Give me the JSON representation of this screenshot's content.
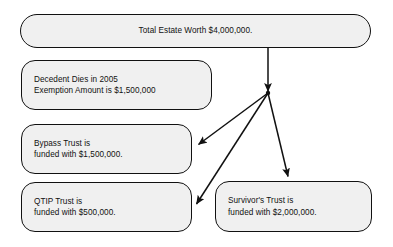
{
  "diagram": {
    "background_color": "#ffffff",
    "node_fill_color": "#f0f0f0",
    "node_border_color": "#111111",
    "text_color": "#111111",
    "nodes": [
      {
        "id": "total-estate",
        "name": "total-estate-node",
        "lines": [
          "Total Estate Worth $4,000,000."
        ],
        "x": 20,
        "y": 14,
        "width": 351,
        "height": 34,
        "align": "center"
      },
      {
        "id": "decedent",
        "name": "decedent-node",
        "lines": [
          "Decedent Dies in 2005",
          "Exemption Amount is $1,500,000"
        ],
        "x": 21,
        "y": 60,
        "width": 191,
        "height": 50,
        "align": "left"
      },
      {
        "id": "bypass-trust",
        "name": "bypass-trust-node",
        "lines": [
          "Bypass Trust is",
          "funded with $1,500,000."
        ],
        "x": 21,
        "y": 124,
        "width": 171,
        "height": 50,
        "align": "left"
      },
      {
        "id": "qtip-trust",
        "name": "qtip-trust-node",
        "lines": [
          "QTIP Trust is",
          "funded with $500,000."
        ],
        "x": 21,
        "y": 182,
        "width": 171,
        "height": 50,
        "align": "left"
      },
      {
        "id": "survivors-trust",
        "name": "survivors-trust-node",
        "lines": [
          "Survivor's Trust is",
          "funded with $2,000,000."
        ],
        "x": 215,
        "y": 181,
        "width": 157,
        "height": 51,
        "align": "left"
      }
    ],
    "junction": {
      "name": "arrow-junction-point",
      "x": 268,
      "y": 93
    },
    "edges": [
      {
        "id": "estate-to-junction",
        "name": "edge-total-estate-to-junction",
        "from": "total-estate",
        "to": "junction",
        "x1": 268,
        "y1": 48,
        "x2": 268,
        "y2": 93,
        "arrowhead": "end"
      },
      {
        "id": "junction-to-bypass",
        "name": "edge-junction-to-bypass-trust",
        "from": "junction",
        "to": "bypass-trust",
        "x1": 268,
        "y1": 93,
        "x2": 196,
        "y2": 146,
        "arrowhead": "end"
      },
      {
        "id": "junction-to-qtip",
        "name": "edge-junction-to-qtip-trust",
        "from": "junction",
        "to": "qtip-trust",
        "x1": 268,
        "y1": 93,
        "x2": 194,
        "y2": 206,
        "arrowhead": "end"
      },
      {
        "id": "junction-to-survivors",
        "name": "edge-junction-to-survivors-trust",
        "from": "junction",
        "to": "survivors-trust",
        "x1": 268,
        "y1": 93,
        "x2": 288,
        "y2": 179,
        "arrowhead": "end"
      }
    ]
  }
}
